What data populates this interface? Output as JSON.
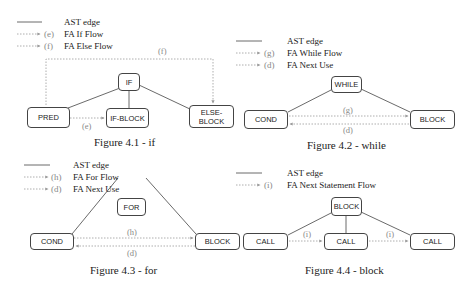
{
  "figures": [
    {
      "id": "4.1",
      "caption": "Figure 4.1 - if",
      "legend": [
        {
          "style": "solid",
          "tag": "",
          "label": "AST edge"
        },
        {
          "style": "dashed-arrow",
          "tag": "(e)",
          "label": "FA If Flow"
        },
        {
          "style": "dashed-arrow",
          "tag": "(f)",
          "label": "FA Else Flow"
        }
      ],
      "nodes": {
        "root": "IF",
        "a": "PRED",
        "b": "IF-BLOCK",
        "c": "ELSE-BLOCK",
        "c1": "ELSE-",
        "c2": "BLOCK"
      },
      "edge_labels": {
        "e": "(e)",
        "f": "(f)"
      }
    },
    {
      "id": "4.2",
      "caption": "Figure 4.2 - while",
      "legend": [
        {
          "style": "solid",
          "tag": "",
          "label": "AST edge"
        },
        {
          "style": "dashed-arrow",
          "tag": "(g)",
          "label": "FA While Flow"
        },
        {
          "style": "dashed-arrow",
          "tag": "(d)",
          "label": "FA Next Use"
        }
      ],
      "nodes": {
        "root": "WHILE",
        "a": "COND",
        "b": "BLOCK"
      },
      "edge_labels": {
        "g": "(g)",
        "d": "(d)"
      }
    },
    {
      "id": "4.3",
      "caption": "Figure 4.3 - for",
      "legend": [
        {
          "style": "solid",
          "tag": "",
          "label": "AST edge"
        },
        {
          "style": "dashed-arrow",
          "tag": "(h)",
          "label": "FA For Flow"
        },
        {
          "style": "dashed-arrow",
          "tag": "(d)",
          "label": "FA Next Use"
        }
      ],
      "nodes": {
        "root": "FOR",
        "a": "COND",
        "b": "BLOCK"
      },
      "edge_labels": {
        "h": "(h)",
        "d": "(d)"
      }
    },
    {
      "id": "4.4",
      "caption": "Figure 4.4 - block",
      "legend": [
        {
          "style": "solid",
          "tag": "",
          "label": "AST edge"
        },
        {
          "style": "dashed-arrow",
          "tag": "(i)",
          "label": "FA Next Statement Flow"
        }
      ],
      "nodes": {
        "root": "BLOCK",
        "a": "CALL",
        "b": "CALL",
        "c": "CALL"
      },
      "edge_labels": {
        "i1": "(i)",
        "i2": "(i)"
      }
    }
  ],
  "colors": {
    "ast_edge": "#444444",
    "fa_edge": "#999999",
    "node_border": "#444444"
  }
}
